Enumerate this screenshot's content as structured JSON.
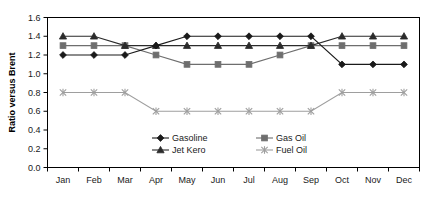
{
  "chart_data": {
    "type": "line",
    "title": "",
    "xlabel": "",
    "ylabel": "Ratio versus Brent",
    "categories": [
      "Jan",
      "Feb",
      "Mar",
      "Apr",
      "May",
      "Jun",
      "Jul",
      "Aug",
      "Sep",
      "Oct",
      "Nov",
      "Dec"
    ],
    "ylim": [
      0.0,
      1.6
    ],
    "ytick_labels": [
      "0.0",
      "0.2",
      "0.4",
      "0.6",
      "0.8",
      "1.0",
      "1.2",
      "1.4",
      "1.6"
    ],
    "ytick_values": [
      0.0,
      0.2,
      0.4,
      0.6,
      0.8,
      1.0,
      1.2,
      1.4,
      1.6
    ],
    "grid": false,
    "legend_position": "inside-bottom-center",
    "series": [
      {
        "name": "Gasoline",
        "marker": "diamond",
        "color": "#1a1a1a",
        "values": [
          1.2,
          1.2,
          1.2,
          1.3,
          1.4,
          1.4,
          1.4,
          1.4,
          1.4,
          1.1,
          1.1,
          1.1
        ]
      },
      {
        "name": "Gas Oil",
        "marker": "square",
        "color": "#6e6e6e",
        "values": [
          1.3,
          1.3,
          1.3,
          1.2,
          1.1,
          1.1,
          1.1,
          1.2,
          1.3,
          1.3,
          1.3,
          1.3
        ]
      },
      {
        "name": "Jet Kero",
        "marker": "triangle",
        "color": "#2b2b2b",
        "values": [
          1.4,
          1.4,
          1.3,
          1.3,
          1.3,
          1.3,
          1.3,
          1.3,
          1.3,
          1.4,
          1.4,
          1.4
        ]
      },
      {
        "name": "Fuel Oil",
        "marker": "cross",
        "color": "#9e9e9e",
        "values": [
          0.8,
          0.8,
          0.8,
          0.6,
          0.6,
          0.6,
          0.6,
          0.6,
          0.6,
          0.8,
          0.8,
          0.8
        ]
      }
    ]
  },
  "axes": {
    "y_title": "Ratio versus Brent"
  },
  "legend": {
    "entries": [
      {
        "label": "Gasoline"
      },
      {
        "label": "Gas Oil"
      },
      {
        "label": "Jet Kero"
      },
      {
        "label": "Fuel Oil"
      }
    ]
  }
}
